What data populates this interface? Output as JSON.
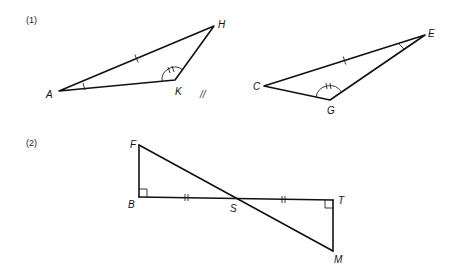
{
  "problems": [
    {
      "number_label": "(1)",
      "triangles": [
        {
          "name": "AHK",
          "vertices": {
            "A": [
              59,
              91
            ],
            "H": [
              214,
              26
            ],
            "K": [
              175,
              80
            ]
          },
          "labels": {
            "A": "A",
            "H": "H",
            "K": "K"
          },
          "marks": {
            "side_AH": "single tick",
            "angle_A": "single tick",
            "angle_K": "double arc tick"
          }
        },
        {
          "name": "CEG",
          "vertices": {
            "C": [
              264,
              86
            ],
            "E": [
              425,
              35
            ],
            "G": [
              330,
              100
            ]
          },
          "labels": {
            "C": "C",
            "E": "E",
            "G": "G"
          },
          "marks": {
            "side_CE": "single tick",
            "angle_E": "single tick",
            "angle_G": "double arc tick"
          }
        }
      ],
      "separator_mark": "//"
    },
    {
      "number_label": "(2)",
      "points": {
        "F": [
          139,
          145
        ],
        "B": [
          139,
          197
        ],
        "S": [
          236,
          199
        ],
        "T": [
          333,
          200
        ],
        "M": [
          333,
          251
        ]
      },
      "labels": {
        "F": "F",
        "B": "B",
        "S": "S",
        "T": "T",
        "M": "M"
      },
      "marks": {
        "BS": "double tick",
        "ST": "double tick",
        "angle_B": "right angle",
        "angle_T": "right angle"
      }
    }
  ]
}
